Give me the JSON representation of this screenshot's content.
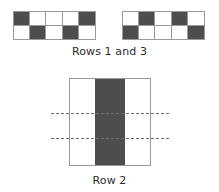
{
  "figure_top": {
    "caption": "Rows 1 and 3",
    "grid_left": {
      "columns": 5,
      "rows": 2,
      "cells": [
        [
          "dark",
          "light",
          "light",
          "light",
          "dark"
        ],
        [
          "light",
          "dark",
          "light",
          "dark",
          "light"
        ]
      ]
    },
    "grid_right": {
      "columns": 5,
      "rows": 2,
      "cells": [
        [
          "light",
          "dark",
          "light",
          "dark",
          "light"
        ],
        [
          "dark",
          "light",
          "light",
          "light",
          "dark"
        ]
      ]
    }
  },
  "figure_bottom": {
    "caption": "Row 2",
    "band_position": "center",
    "dashed_lines": 2
  },
  "colors": {
    "dark_cell": "#4d4d4d",
    "light_cell": "#ffffff",
    "outline": "#9a9a9a",
    "dashed": "#6f6f6f",
    "text": "#2b2b2b"
  }
}
